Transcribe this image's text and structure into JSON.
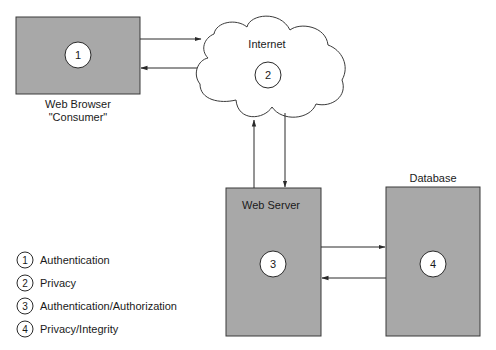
{
  "diagram": {
    "nodes": {
      "browser": {
        "label": "Web Browser",
        "sublabel": "\"Consumer\"",
        "marker": "1"
      },
      "internet": {
        "label": "Internet",
        "marker": "2"
      },
      "server": {
        "label": "Web Server",
        "marker": "3"
      },
      "database": {
        "label": "Database",
        "marker": "4"
      }
    },
    "connections": [
      {
        "from": "browser",
        "to": "internet"
      },
      {
        "from": "internet",
        "to": "browser"
      },
      {
        "from": "server",
        "to": "internet"
      },
      {
        "from": "internet",
        "to": "server"
      },
      {
        "from": "server",
        "to": "database"
      },
      {
        "from": "database",
        "to": "server"
      }
    ],
    "legend": [
      {
        "number": "1",
        "label": "Authentication"
      },
      {
        "number": "2",
        "label": "Privacy"
      },
      {
        "number": "3",
        "label": "Authentication/Authorization"
      },
      {
        "number": "4",
        "label": "Privacy/Integrity"
      }
    ],
    "colors": {
      "box_fill": "#a8a8a8",
      "stroke": "#2a2a2a",
      "background": "#ffffff"
    }
  }
}
